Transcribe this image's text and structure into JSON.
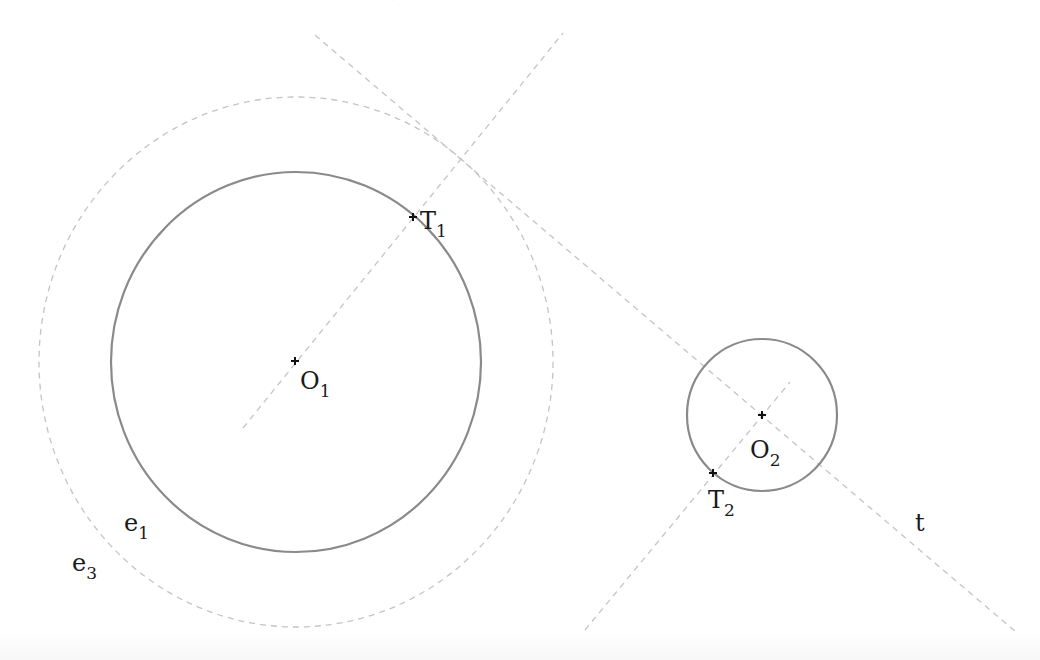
{
  "caption_clipped": {
    "visible_fragments": [
      {
        "text": "1",
        "x": 193
      },
      {
        "text": "2",
        "x": 238
      },
      {
        "text": "1",
        "x": 300
      },
      {
        "text": "2",
        "x": 345
      },
      {
        "text": ",",
        "x": 392
      }
    ]
  },
  "figure": {
    "colors": {
      "solid_circle": "#8a8a8a",
      "dashed_line": "#c4c4c4",
      "label": "#1a1a1a"
    },
    "circles": [
      {
        "id": "e1",
        "cx": 296,
        "cy": 362,
        "rx": 185,
        "ry": 190,
        "style": "solid"
      },
      {
        "id": "e3",
        "cx": 296,
        "cy": 362,
        "rx": 257,
        "ry": 265,
        "style": "dashed"
      },
      {
        "id": "k2",
        "cx": 762,
        "cy": 415,
        "rx": 75,
        "ry": 76,
        "style": "solid"
      }
    ],
    "lines": [
      {
        "id": "t",
        "x1": 315,
        "y1": 35,
        "x2": 1016,
        "y2": 632,
        "style": "dashed"
      },
      {
        "id": "O1T1",
        "x1": 243,
        "y1": 428,
        "x2": 563,
        "y2": 33,
        "style": "dashed"
      },
      {
        "id": "O2T2",
        "x1": 585,
        "y1": 630,
        "x2": 790,
        "y2": 382,
        "style": "dashed"
      }
    ],
    "points": [
      {
        "id": "O1",
        "x": 295,
        "y": 361
      },
      {
        "id": "T1",
        "x": 413,
        "y": 217
      },
      {
        "id": "O2",
        "x": 762,
        "y": 415
      },
      {
        "id": "T2",
        "x": 713,
        "y": 473
      }
    ],
    "labels": {
      "T1": {
        "main": "T",
        "sub": "1"
      },
      "O1": {
        "main": "O",
        "sub": "1"
      },
      "O2": {
        "main": "O",
        "sub": "2"
      },
      "T2": {
        "main": "T",
        "sub": "2"
      },
      "e1": {
        "main": "e",
        "sub": "1"
      },
      "e3": {
        "main": "e",
        "sub": "3"
      },
      "t": {
        "main": "t"
      }
    }
  }
}
